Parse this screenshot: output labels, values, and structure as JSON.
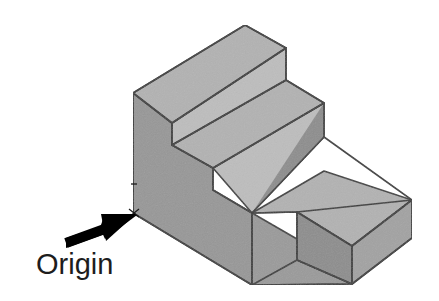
{
  "figure": {
    "type": "isometric-line-drawing",
    "background_color": "#ffffff",
    "annotation": {
      "label": "Origin",
      "label_color": "#1d1d1d",
      "arrow_color": "#000000",
      "arrow_tail": [
        66,
        243
      ],
      "arrow_tip": [
        136,
        214
      ],
      "points_to": "front-left-bottom-corner"
    },
    "colors": {
      "top_face": "#b2b2b2",
      "left_face": "#979797",
      "front_face": "#9a9a9a",
      "riser_face": "#bdbdbd",
      "right_face": "#8d8d8d",
      "dark_face": "#888888",
      "outline": "#3c3c3c",
      "inner_line": "#4a4a4a"
    },
    "geometry": {
      "projection": "isometric",
      "origin_point": [
        133,
        213
      ],
      "vertices": {
        "v_origin": [
          133,
          213
        ],
        "v_left_top": [
          133,
          93
        ],
        "v_peak": [
          245,
          25
        ],
        "v_top_right": [
          286,
          48
        ],
        "v_top_front_right": [
          286,
          80
        ],
        "v_step1_front_left": [
          172,
          123
        ],
        "v_step1_front_right": [
          286,
          190
        ],
        "v_step2_top_left": [
          172,
          145
        ],
        "v_step2_peak_right": [
          324,
          103
        ],
        "v_step2_right": [
          324,
          137
        ],
        "v_step2_front_left": [
          213,
          168
        ],
        "v_notch_top": [
          297,
          212
        ],
        "v_notch_bottom": [
          297,
          260
        ],
        "v_far_right": [
          412,
          200
        ],
        "v_far_right_low": [
          412,
          238
        ],
        "v_bottom_front": [
          252,
          285
        ],
        "v_bottom_right": [
          352,
          284
        ],
        "v_right_mid": [
          352,
          246
        ]
      }
    },
    "faces": [
      {
        "name": "left-side-face",
        "shade": "mid"
      },
      {
        "name": "step1-top-face",
        "shade": "light"
      },
      {
        "name": "step1-right-end-face",
        "shade": "dark"
      },
      {
        "name": "step1-riser-face",
        "shade": "lighter"
      },
      {
        "name": "step2-top-face",
        "shade": "light"
      },
      {
        "name": "step2-right-end-face",
        "shade": "dark"
      },
      {
        "name": "step2-riser-face",
        "shade": "lighter"
      },
      {
        "name": "base-top-face",
        "shade": "light"
      },
      {
        "name": "base-front-face",
        "shade": "mid"
      },
      {
        "name": "base-notch-face",
        "shade": "dark"
      },
      {
        "name": "base-right-face",
        "shade": "dark"
      }
    ]
  }
}
